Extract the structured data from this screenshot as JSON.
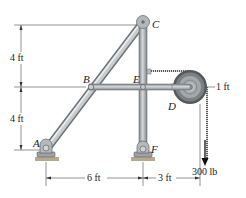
{
  "figure": {
    "points": {
      "A": "A",
      "B": "B",
      "C": "C",
      "D": "D",
      "E": "E",
      "F": "F"
    },
    "dimensions": {
      "vertical_upper": "4 ft",
      "vertical_lower": "4 ft",
      "horizontal_left": "6 ft",
      "horizontal_right": "3 ft",
      "pulley_radius": "1 ft"
    },
    "load": "300 lb",
    "colors": {
      "member": "#a9aeb1",
      "member_edge": "#6f7478",
      "pulley_outer": "#5b5f63",
      "pulley_inner": "#c4c8ca",
      "dim_line": "#555555"
    }
  }
}
